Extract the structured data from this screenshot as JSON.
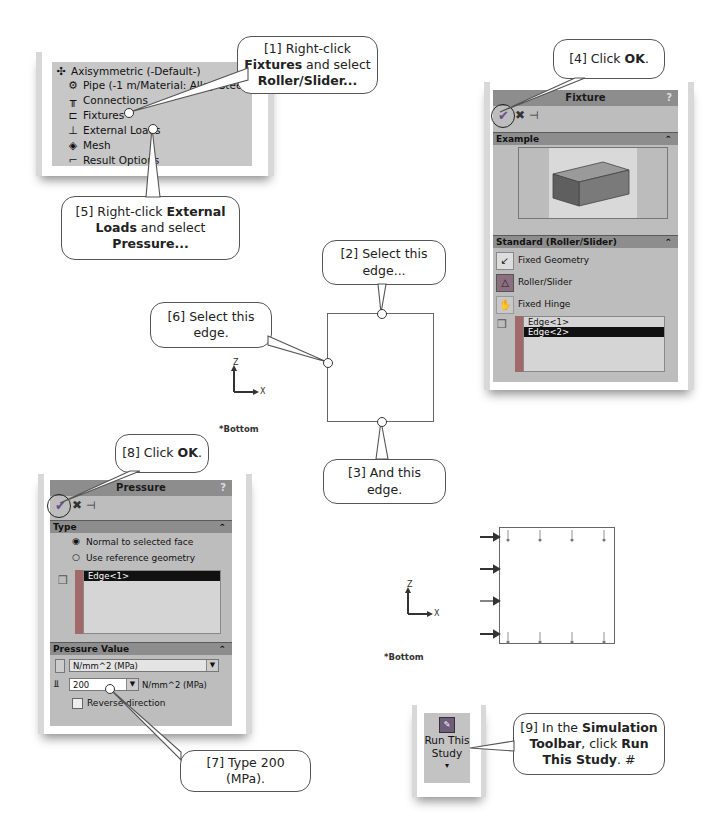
{
  "tree": {
    "items": [
      {
        "label": "Axisymmetric (-Default-)",
        "icon": "study-icon"
      },
      {
        "label": "Pipe (-1 m/Material: Alloy Steel-)",
        "icon": "part-icon"
      },
      {
        "label": "Connections",
        "icon": "connections-icon"
      },
      {
        "label": "Fixtures",
        "icon": "fixtures-icon"
      },
      {
        "label": "External Loads",
        "icon": "external-loads-icon"
      },
      {
        "label": "Mesh",
        "icon": "mesh-icon"
      },
      {
        "label": "Result Options",
        "icon": "result-options-icon"
      }
    ]
  },
  "callouts": {
    "c1": {
      "pre": "[1] Right-click ",
      "b1": "Fixtures",
      "mid": " and select ",
      "b2": "Roller/Slider..."
    },
    "c2": {
      "text": "[2] Select this edge..."
    },
    "c3": {
      "text": "[3] And this edge."
    },
    "c4": {
      "pre": "[4] Click ",
      "b1": "OK",
      "post": "."
    },
    "c5": {
      "pre": "[5] Right-click ",
      "b1": "External Loads",
      "mid": " and select ",
      "b2": "Pressure..."
    },
    "c6": {
      "text": "[6] Select this edge."
    },
    "c7": {
      "text": "[7] Type 200 (MPa)."
    },
    "c8": {
      "pre": "[8] Click ",
      "b1": "OK",
      "post": "."
    },
    "c9": {
      "pre": "[9] In the ",
      "b1": "Simulation Toolbar",
      "mid": ", click ",
      "b2": "Run This Study",
      "post": ". #"
    }
  },
  "fixture_panel": {
    "title": "Fixture",
    "help": "?",
    "toolbar": {
      "ok": "OK",
      "cancel": "Cancel",
      "pin": "Keep visible"
    },
    "example_section": "Example",
    "standard_section": "Standard (Roller/Slider)",
    "options": [
      "Fixed Geometry",
      "Roller/Slider",
      "Fixed Hinge"
    ],
    "selected_option": "Roller/Slider",
    "selection_list": [
      "Edge<1>",
      "Edge<2>"
    ],
    "selected_item": "Edge<2>"
  },
  "pressure_panel": {
    "title": "Pressure",
    "help": "?",
    "type_section": "Type",
    "radio_options": [
      "Normal to selected face",
      "Use reference geometry"
    ],
    "selected_radio": "Normal to selected face",
    "selection_list": [
      "Edge<1>"
    ],
    "pressure_value_section": "Pressure Value",
    "units": "N/mm^2 (MPa)",
    "value": "200",
    "value_units": "N/mm^2 (MPa)",
    "reverse_direction": "Reverse direction"
  },
  "viewport": {
    "axis_z": "Z",
    "axis_x": "X",
    "view_label": "*Bottom"
  },
  "toolbar_button": {
    "label_line1": "Run This",
    "label_line2": "Study",
    "dropdown": "▾"
  },
  "colors": {
    "panel_gray": "#bdbdbd",
    "header_gray": "#8d8d8d",
    "selection_black": "#111111"
  }
}
